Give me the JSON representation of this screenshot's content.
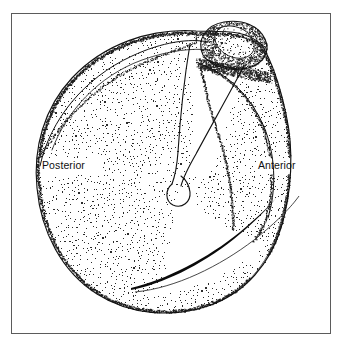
{
  "figure": {
    "kind": "anatomical-line-drawing",
    "background_color": "#ffffff",
    "frame": {
      "name": "figure-border",
      "color": "#5b5b5b",
      "x": 11,
      "y": 13,
      "width": 320,
      "height": 321,
      "stroke_width": 1
    },
    "ink_color": "#111111",
    "stipple_color": "#2b2b2b"
  },
  "labels": [
    {
      "id": "posterior",
      "text": "Posterior",
      "x": 42,
      "y": 160,
      "font_size": "10.5px",
      "color": "#101010"
    },
    {
      "id": "anterior",
      "text": "Anterior",
      "x": 258,
      "y": 160,
      "font_size": "10.5px",
      "color": "#101010"
    }
  ],
  "label_text": {
    "posterior": "Posterior",
    "anterior": "Anterior"
  },
  "chart_data": {
    "type": "line",
    "title": "",
    "xlabel": "",
    "ylabel": "",
    "annotations": [
      "Posterior",
      "Anterior"
    ],
    "outlines": {
      "body_outline": "M 196 31 C 150 28 104 44 72 78 C 44 108 33 148 37 188 C 41 232 62 272 97 294 C 130 315 172 318 208 306 C 246 293 270 263 281 228 C 292 192 290 152 284 118 C 279 88 271 62 262 47",
      "body_outline_right": "M 262 47 C 272 60 281 84 286 112 C 292 148 294 190 284 226 C 273 264 248 294 210 307 C 174 319 131 316 97 295",
      "inner_arc_upper": "M 60 98 C 92 64 138 48 180 50 C 206 52 226 60 238 72",
      "spine_ridge_left": "M 186 46 C 178 70 172 96 170 122 C 168 146 170 164 174 178",
      "spine_ridge_right": "M 238 72 C 222 96 206 124 192 152 C 184 168 180 178 178 186",
      "spine_tip_bulb": "M 166 176 C 160 184 162 194 170 198 C 179 202 188 196 188 186 C 188 178 183 172 176 170",
      "glenoid_fossa_arc": "M 196 62 C 224 70 250 94 262 126 C 272 152 274 182 268 210",
      "acromion_outline": "M 202 52 C 198 38 208 26 224 23 C 240 20 256 26 262 38 C 268 50 262 62 248 66 C 232 70 212 66 204 58 Z",
      "acromion_inner": "M 214 38 C 212 30 220 25 230 26 C 241 27 250 33 252 42 C 254 51 246 58 236 57 C 225 56 216 48 214 38 Z",
      "coracoid_neck": "M 202 58 C 210 64 224 70 238 71",
      "scapular_spine_blade": "M 132 286 C 160 276 196 256 228 232 C 248 217 262 206 272 198",
      "scapular_spine_blade2": "M 132 286 C 162 282 200 262 232 238 C 252 223 266 210 274 200",
      "lower_ridge": "M 134 288 C 172 282 214 262 248 236 C 272 217 288 202 296 192"
    },
    "stipple": {
      "description": "radiating arc stipple fill over scapular body",
      "center_x": 176,
      "center_y": 188,
      "rings": 64,
      "dot_size": 0.85
    }
  }
}
